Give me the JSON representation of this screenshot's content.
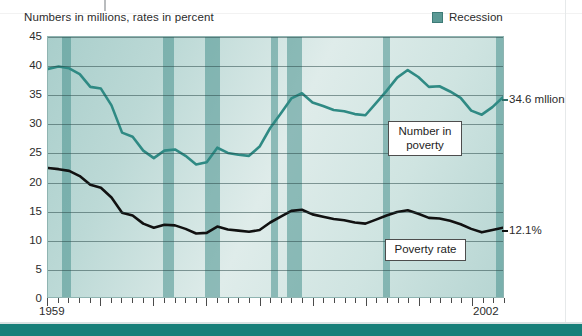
{
  "caption": "Numbers in millions, rates in percent",
  "legend": {
    "items": [
      {
        "label": "Recession",
        "color": "#5b9995"
      }
    ]
  },
  "annotations": {
    "number_in_poverty": "Number in\npoverty",
    "poverty_rate": "Poverty rate"
  },
  "edge_labels": {
    "number": "34.6 mllion",
    "rate": "12.1%"
  },
  "axis": {
    "x_start": "1959",
    "x_end": "2002",
    "y_ticks": [
      "45",
      "40",
      "35",
      "30",
      "25",
      "20",
      "15",
      "10",
      "5",
      "0"
    ]
  },
  "chart_data": {
    "type": "line",
    "title": "Numbers in millions, rates in percent",
    "xlabel": "",
    "ylabel": "",
    "xlim": [
      1959,
      2002
    ],
    "ylim": [
      0,
      45
    ],
    "grid": true,
    "legend_position": "top-right",
    "x": [
      1959,
      1960,
      1961,
      1962,
      1963,
      1964,
      1965,
      1966,
      1967,
      1968,
      1969,
      1970,
      1971,
      1972,
      1973,
      1974,
      1975,
      1976,
      1977,
      1978,
      1979,
      1980,
      1981,
      1982,
      1983,
      1984,
      1985,
      1986,
      1987,
      1988,
      1989,
      1990,
      1991,
      1992,
      1993,
      1994,
      1995,
      1996,
      1997,
      1998,
      1999,
      2000,
      2001,
      2002
    ],
    "series": [
      {
        "name": "Number in poverty",
        "units": "millions",
        "color": "#2f8a84",
        "values": [
          39.5,
          39.9,
          39.6,
          38.6,
          36.4,
          36.1,
          33.2,
          28.5,
          27.8,
          25.4,
          24.1,
          25.4,
          25.6,
          24.5,
          23.0,
          23.4,
          25.9,
          25.0,
          24.7,
          24.5,
          26.1,
          29.3,
          31.8,
          34.4,
          35.3,
          33.7,
          33.1,
          32.4,
          32.2,
          31.7,
          31.5,
          33.6,
          35.7,
          38.0,
          39.3,
          38.1,
          36.4,
          36.5,
          35.6,
          34.5,
          32.3,
          31.6,
          32.9,
          34.6
        ]
      },
      {
        "name": "Poverty rate",
        "units": "percent",
        "color": "#111111",
        "values": [
          22.4,
          22.2,
          21.9,
          21.0,
          19.5,
          19.0,
          17.3,
          14.7,
          14.2,
          12.8,
          12.1,
          12.6,
          12.5,
          11.9,
          11.1,
          11.2,
          12.3,
          11.8,
          11.6,
          11.4,
          11.7,
          13.0,
          14.0,
          15.0,
          15.2,
          14.4,
          14.0,
          13.6,
          13.4,
          13.0,
          12.8,
          13.5,
          14.2,
          14.8,
          15.1,
          14.5,
          13.8,
          13.7,
          13.3,
          12.7,
          11.9,
          11.3,
          11.7,
          12.1
        ]
      }
    ],
    "recession_bands": [
      {
        "start": 1960.3,
        "end": 1961.2
      },
      {
        "start": 1969.8,
        "end": 1970.9
      },
      {
        "start": 1973.8,
        "end": 1975.2
      },
      {
        "start": 1980.0,
        "end": 1980.6
      },
      {
        "start": 1981.5,
        "end": 1982.9
      },
      {
        "start": 1990.5,
        "end": 1991.2
      },
      {
        "start": 2001.2,
        "end": 2001.9
      }
    ],
    "end_annotations": [
      {
        "series": "Number in poverty",
        "text": "34.6 mllion"
      },
      {
        "series": "Poverty rate",
        "text": "12.1%"
      }
    ]
  }
}
